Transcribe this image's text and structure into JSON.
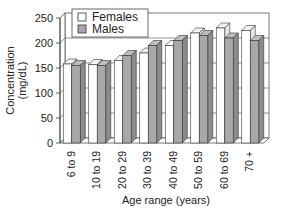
{
  "chart_data": {
    "type": "bar",
    "style": "3d-clustered",
    "title": "",
    "xlabel": "Age range (years)",
    "ylabel": "Concentration\n(mg/dL)",
    "ylabel_lines": [
      "Concentration",
      "(mg/dL)"
    ],
    "ylim": [
      0,
      250
    ],
    "yticks": [
      0,
      50,
      100,
      150,
      200,
      250
    ],
    "grid": true,
    "legend_position": "top-left",
    "categories": [
      "6 to 9",
      "10 to 19",
      "20 to 29",
      "30 to 39",
      "40 to 49",
      "50 to 59",
      "60 to 69",
      "70 +"
    ],
    "series": [
      {
        "name": "Females",
        "color": "#ffffff",
        "values": [
          158,
          157,
          165,
          180,
          195,
          220,
          230,
          225
        ]
      },
      {
        "name": "Males",
        "color": "#a9a9a9",
        "values": [
          155,
          155,
          175,
          195,
          205,
          215,
          210,
          205
        ]
      }
    ]
  }
}
